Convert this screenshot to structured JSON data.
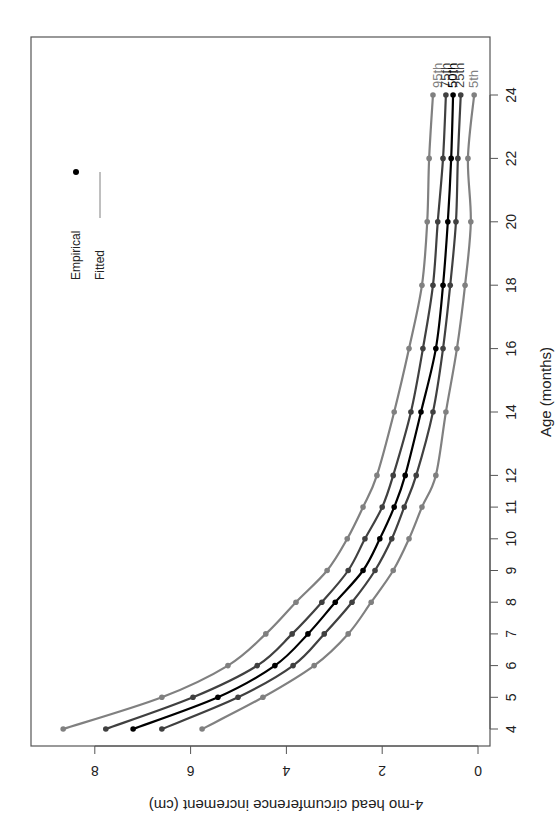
{
  "chart_data": {
    "type": "line",
    "orientation": "rotated-90-clockwise",
    "title": "",
    "xlabel": "Age (months)",
    "ylabel": "4-mo head circumference increment (cm)",
    "x": [
      4,
      5,
      6,
      7,
      8,
      9,
      10,
      11,
      12,
      14,
      16,
      18,
      20,
      22,
      24
    ],
    "x_ticks": [
      4,
      5,
      6,
      7,
      8,
      9,
      10,
      11,
      12,
      14,
      16,
      18,
      20,
      22,
      24
    ],
    "y_ticks": [
      0,
      2,
      4,
      6,
      8
    ],
    "xlim": [
      3.5,
      25
    ],
    "ylim": [
      -0.25,
      9.3
    ],
    "grid": false,
    "legend": {
      "position": "upper-left (rotated)",
      "entries": [
        {
          "label": "Empirical",
          "marker": "point"
        },
        {
          "label": "Fitted",
          "marker": "line"
        }
      ]
    },
    "series": [
      {
        "name": "95th",
        "color": "#808080",
        "values": [
          8.66,
          6.6,
          5.22,
          4.43,
          3.8,
          3.15,
          2.73,
          2.4,
          2.11,
          1.75,
          1.44,
          1.17,
          1.06,
          1.02,
          0.94
        ]
      },
      {
        "name": "75th",
        "color": "#404040",
        "values": [
          7.77,
          5.95,
          4.61,
          3.88,
          3.26,
          2.71,
          2.36,
          2.0,
          1.77,
          1.4,
          1.15,
          0.94,
          0.84,
          0.73,
          0.67
        ]
      },
      {
        "name": "50th",
        "color": "#000000",
        "values": [
          7.2,
          5.43,
          4.24,
          3.55,
          2.98,
          2.4,
          2.05,
          1.75,
          1.52,
          1.19,
          0.88,
          0.73,
          0.63,
          0.56,
          0.52
        ]
      },
      {
        "name": "25th",
        "color": "#404040",
        "values": [
          6.6,
          5.01,
          3.86,
          3.21,
          2.63,
          2.15,
          1.8,
          1.54,
          1.29,
          0.94,
          0.73,
          0.58,
          0.46,
          0.42,
          0.36
        ]
      },
      {
        "name": "5th",
        "color": "#808080",
        "values": [
          5.76,
          4.49,
          3.42,
          2.71,
          2.23,
          1.77,
          1.44,
          1.17,
          0.88,
          0.67,
          0.44,
          0.27,
          0.15,
          0.21,
          0.08
        ]
      }
    ]
  },
  "labels": {
    "x_axis_title": "Age (months)",
    "y_axis_title": "4-mo head circumference increment (cm)",
    "legend_empirical": "Empirical",
    "legend_fitted": "Fitted"
  }
}
